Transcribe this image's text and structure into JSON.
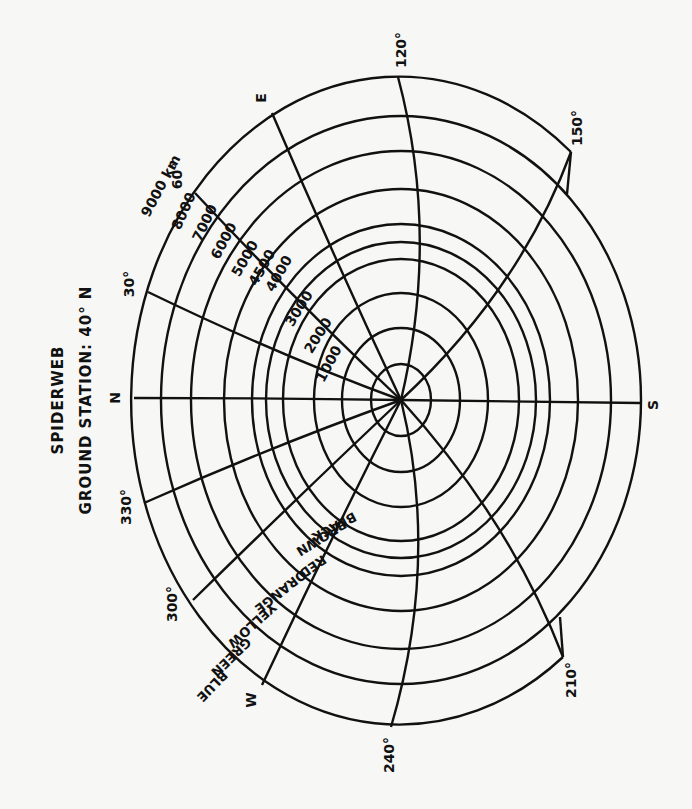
{
  "title": {
    "line1": "SPIDERWEB",
    "line2": "GROUND STATION: 40° N"
  },
  "center": {
    "x": 401,
    "y": 400
  },
  "rings": [
    {
      "km": 1000,
      "label": "1000",
      "rx": 30,
      "ry": 36
    },
    {
      "km": 2000,
      "label": "2000",
      "rx": 59,
      "ry": 72
    },
    {
      "km": 3000,
      "label": "3000",
      "rx": 87,
      "ry": 107
    },
    {
      "km": 4000,
      "label": "4000",
      "rx": 118,
      "ry": 141
    },
    {
      "km": 4500,
      "label": "4500",
      "rx": 135,
      "ry": 158
    },
    {
      "km": 5000,
      "label": "5000",
      "rx": 149,
      "ry": 176
    },
    {
      "km": 6000,
      "label": "6000",
      "rx": 177,
      "ry": 211
    },
    {
      "km": 7000,
      "label": "7000",
      "rx": 210,
      "ry": 249
    },
    {
      "km": 8000,
      "label": "8000",
      "rx": 240,
      "ry": 284
    },
    {
      "km": 9000,
      "label": "9000 km",
      "rx": 268,
      "ry": 324
    }
  ],
  "color_bands": [
    {
      "label": "BLACK",
      "between": "1000-2000"
    },
    {
      "label": "BROWN",
      "between": "2000-3000"
    },
    {
      "label": "RED",
      "between": "3000-4000"
    },
    {
      "label": "ORANGE",
      "between": "4000-5000"
    },
    {
      "label": "YELLOW",
      "between": "5000-6000"
    },
    {
      "label": "GREEN",
      "between": "6000-7000"
    },
    {
      "label": "BLUE",
      "between": "7000-8000"
    }
  ],
  "azimuths": [
    {
      "label": "N",
      "end": [
        134,
        398
      ],
      "ctrl": [
        268,
        398
      ],
      "lx": 116,
      "ly": 398
    },
    {
      "label": "30°",
      "end": [
        148,
        292
      ],
      "ctrl": [
        278,
        355
      ],
      "lx": 130,
      "ly": 284
    },
    {
      "label": "60°",
      "end": [
        195,
        193
      ],
      "ctrl": [
        300,
        305
      ],
      "lx": 178,
      "ly": 176
    },
    {
      "label": "E",
      "end": [
        272,
        113
      ],
      "ctrl": [
        335,
        260
      ],
      "lx": 262,
      "ly": 98
    },
    {
      "label": "120°",
      "end": [
        398,
        77
      ],
      "ctrl": [
        440,
        235
      ],
      "lx": 402,
      "ly": 50
    },
    {
      "label": "150°",
      "end": [
        571,
        152
      ],
      "ctrl": [
        520,
        290
      ],
      "lx": 578,
      "ly": 128
    },
    {
      "label": "S",
      "end": [
        640,
        403
      ],
      "ctrl": [
        520,
        401
      ],
      "lx": 654,
      "ly": 405
    },
    {
      "label": "210°",
      "end": [
        563,
        657
      ],
      "ctrl": [
        510,
        520
      ],
      "lx": 572,
      "ly": 680
    },
    {
      "label": "240°",
      "end": [
        391,
        727
      ],
      "ctrl": [
        440,
        560
      ],
      "lx": 390,
      "ly": 755
    },
    {
      "label": "W",
      "end": [
        262,
        685
      ],
      "ctrl": [
        330,
        540
      ],
      "lx": 252,
      "ly": 700
    },
    {
      "label": "300°",
      "end": [
        193,
        600
      ],
      "ctrl": [
        300,
        495
      ],
      "lx": 173,
      "ly": 604
    },
    {
      "label": "330°",
      "end": [
        144,
        503
      ],
      "ctrl": [
        275,
        445
      ],
      "lx": 127,
      "ly": 507
    }
  ],
  "colors": {
    "ink": "#111111",
    "paper": "#f7f7f5"
  }
}
